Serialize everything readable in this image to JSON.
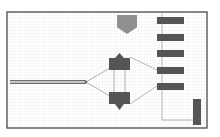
{
  "diagram": {
    "type": "schematic-canvas",
    "frame": {
      "x": 7,
      "y": 12,
      "width": 200,
      "height": 116,
      "stroke": "#4a4a4a"
    },
    "grid": {
      "spacing": 3,
      "color": "#e6e6e6"
    },
    "colors": {
      "dark": "#555555",
      "gray": "#8f8f8f",
      "wire": "#9a9a9a",
      "bus": "#6e6e6e"
    },
    "bus": {
      "from": [
        10,
        82
      ],
      "to": [
        86,
        82
      ],
      "lines": 3
    },
    "junction": [
      86,
      82
    ],
    "gates": [
      {
        "id": "gate-top",
        "x": 109,
        "y": 53,
        "width": 21,
        "height": 17,
        "orientation": "up"
      },
      {
        "id": "gate-bottom",
        "x": 109,
        "y": 92,
        "width": 21,
        "height": 18,
        "orientation": "down"
      }
    ],
    "pentagon": {
      "x": 117,
      "y": 15,
      "width": 20,
      "height": 19
    },
    "bars": [
      {
        "x": 157,
        "y": 17,
        "width": 27,
        "height": 7
      },
      {
        "x": 157,
        "y": 34,
        "width": 27,
        "height": 7
      },
      {
        "x": 157,
        "y": 50,
        "width": 27,
        "height": 7
      },
      {
        "x": 157,
        "y": 67,
        "width": 27,
        "height": 7
      },
      {
        "x": 157,
        "y": 83,
        "width": 27,
        "height": 7
      }
    ],
    "side_bar": {
      "x": 193,
      "y": 99,
      "width": 8,
      "height": 26
    },
    "rail": {
      "x": 162,
      "y1": 13,
      "y2": 120,
      "x2": 193
    }
  }
}
